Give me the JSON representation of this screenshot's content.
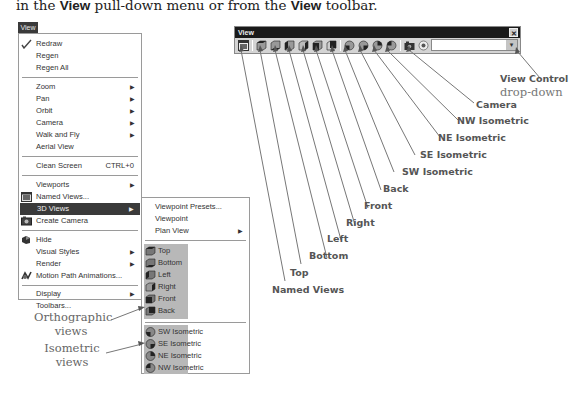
{
  "intro": {
    "prefix": "in the ",
    "bold1": "View",
    "middle": " pull-down menu or from the ",
    "bold2": "View",
    "suffix": " toolbar."
  },
  "main_menu": {
    "title": "View",
    "items": [
      {
        "label": "Redraw",
        "u": "R",
        "rest": "edraw",
        "icon": "pencil-check-icon"
      },
      {
        "label": "Regen"
      },
      {
        "label": "Regen All"
      },
      {
        "label": "Zoom",
        "submenu": true
      },
      {
        "label": "Pan",
        "submenu": true
      },
      {
        "label": "Orbit",
        "submenu": true
      },
      {
        "label": "Camera",
        "submenu": true
      },
      {
        "label": "Walk and Fly",
        "submenu": true
      },
      {
        "label": "Aerial View"
      },
      {
        "label": "Clean Screen",
        "shortcut": "CTRL+0"
      },
      {
        "label": "Viewports",
        "submenu": true
      },
      {
        "label": "Named Views...",
        "icon": "named-views-icon"
      },
      {
        "label": "3D Views",
        "submenu": true,
        "active": true
      },
      {
        "label": "Create Camera",
        "icon": "camera-icon"
      },
      {
        "label": "Hide",
        "icon": "hide-icon"
      },
      {
        "label": "Visual Styles",
        "submenu": true
      },
      {
        "label": "Render",
        "submenu": true
      },
      {
        "label": "Motion Path Animations...",
        "icon": "motion-path-icon"
      },
      {
        "label": "Display",
        "submenu": true
      },
      {
        "label": "Toolbars..."
      }
    ]
  },
  "sub_menu": {
    "items": [
      {
        "label": "Viewpoint Presets..."
      },
      {
        "label": "Viewpoint"
      },
      {
        "label": "Plan View",
        "submenu": true
      }
    ],
    "orthographic": [
      "Top",
      "Bottom",
      "Left",
      "Right",
      "Front",
      "Back"
    ],
    "isometric": [
      "SW Isometric",
      "SE Isometric",
      "NE Isometric",
      "NW Isometric"
    ]
  },
  "toolbar": {
    "title": "View",
    "close": "✕",
    "dropdown_value": "",
    "dropdown_arrow": "▾",
    "buttons": [
      "Named Views",
      "Top",
      "Bottom",
      "Left",
      "Right",
      "Front",
      "Back",
      "SW Isometric",
      "SE Isometric",
      "NE Isometric",
      "NW Isometric",
      "Camera",
      "View Control"
    ]
  },
  "callouts": {
    "named_views": "Named Views",
    "top": "Top",
    "bottom": "Bottom",
    "left": "Left",
    "right": "Right",
    "front": "Front",
    "back": "Back",
    "sw": "SW Isometric",
    "se": "SE Isometric",
    "ne": "NE Isometric",
    "nw": "NW Isometric",
    "camera": "Camera",
    "view_control_1": "View Control",
    "view_control_2": "drop-down",
    "ortho_1": "Orthographic",
    "ortho_2": "views",
    "iso_1": "Isometric",
    "iso_2": "views"
  }
}
